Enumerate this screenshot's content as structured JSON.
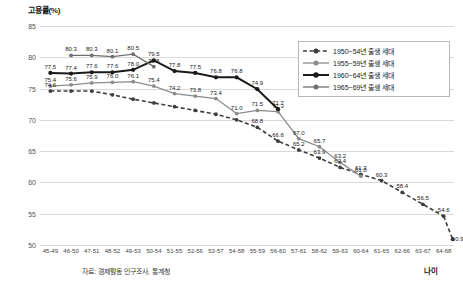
{
  "chart_data": {
    "type": "line",
    "title": "고용률(%)",
    "ylabel": "고용률(%)",
    "xlabel": "나이",
    "source_note": "자료: 경제활동 인구조사, 통계청",
    "ylim": [
      50,
      85
    ],
    "yticks": [
      50,
      55,
      60,
      65,
      70,
      75,
      80,
      85
    ],
    "grid": true,
    "legend_position": "top-right",
    "categories": [
      "45-49",
      "46-50",
      "47-51",
      "48-52",
      "49-53",
      "50-54",
      "51-55",
      "52-56",
      "53-57",
      "54-58",
      "55-59",
      "56-60",
      "57-61",
      "58-62",
      "59-63",
      "60-64",
      "61-65",
      "62-66",
      "63-67",
      "64-68"
    ],
    "series": [
      {
        "name": "1950~54년 출생 세대",
        "color": "#3d3d3d",
        "style": "dashed",
        "start_index": 0,
        "values": [
          74.6,
          74.6,
          74.6,
          74.0,
          73.3,
          72.7,
          72.1,
          71.5,
          70.9,
          70.0,
          68.8,
          66.6,
          65.2,
          63.9,
          62.4,
          61.3,
          60.3,
          58.4,
          56.5,
          54.6
        ],
        "labels": [
          "74.6",
          "",
          "",
          "",
          "",
          "",
          "",
          "",
          "",
          "",
          "68.8",
          "66.6",
          "65.2",
          "63.9",
          "62.4",
          "61.3",
          "60.3",
          "58.4",
          "56.5",
          "54.6"
        ],
        "final_label": "50.9"
      },
      {
        "name": "1955~59년 출생 세대",
        "color": "#8c8c8c",
        "style": "solid",
        "start_index": 0,
        "values": [
          75.4,
          75.6,
          75.9,
          76.0,
          76.1,
          75.4,
          74.2,
          73.8,
          73.4,
          71.0,
          71.5,
          71.3,
          67.0,
          65.7,
          63.2,
          61.0,
          null,
          null,
          null,
          null
        ],
        "labels": [
          "75.4",
          "75.6",
          "75.9",
          "76.0",
          "76.1",
          "75.4",
          "74.2",
          "73.8",
          "73.4",
          "71.0",
          "71.5",
          "71.3",
          "67.0",
          "65.7",
          "63.2",
          "61.0",
          "",
          "",
          "",
          ""
        ]
      },
      {
        "name": "1960~64년 출생 세대",
        "color": "#1a1a1a",
        "style": "solid-heavy",
        "start_index": 0,
        "values": [
          77.5,
          77.4,
          77.6,
          77.6,
          78.0,
          79.5,
          77.8,
          77.5,
          76.8,
          76.8,
          74.9,
          71.7,
          null,
          null,
          null,
          null,
          null,
          null,
          null,
          null
        ],
        "labels": [
          "77.5",
          "77.4",
          "77.6",
          "77.6",
          "78.0",
          "79.5",
          "77.8",
          "77.5",
          "76.8",
          "76.8",
          "74.9",
          "71.7",
          "",
          "",
          "",
          "",
          "",
          "",
          "",
          ""
        ]
      },
      {
        "name": "1965~69년 출생 세대",
        "color": "#6f6f6f",
        "style": "solid-light",
        "start_index": 1,
        "values": [
          null,
          80.3,
          80.3,
          80.1,
          80.5,
          78.5,
          null,
          null,
          null,
          null,
          null,
          null,
          null,
          null,
          null,
          null,
          null,
          null,
          null,
          null
        ],
        "labels": [
          "",
          "80.3",
          "80.3",
          "80.1",
          "80.5",
          "78.5",
          "",
          "",
          "",
          "",
          "",
          "",
          "",
          "",
          "",
          "",
          "",
          "",
          "",
          ""
        ]
      }
    ],
    "extra_labels": [
      {
        "text": "80.3",
        "x": 1,
        "y": 80.3
      },
      {
        "text": "80.3",
        "x": 2,
        "y": 80.3
      },
      {
        "text": "80.1",
        "x": 3,
        "y": 80.1
      },
      {
        "text": "80.5",
        "x": 4,
        "y": 80.5
      },
      {
        "text": "79.5",
        "x": 5,
        "y": 79.5
      },
      {
        "text": "78.5",
        "x": 6,
        "y": 78.5
      },
      {
        "text": "50.9",
        "x": 19,
        "y": 50.9
      }
    ]
  },
  "legend": {
    "items": [
      {
        "label": "1950~54년 출생 세대"
      },
      {
        "label": "1955~59년 출생 세대"
      },
      {
        "label": "1960~64년 출생 세대"
      },
      {
        "label": "1965~69년 출생 세대"
      }
    ]
  }
}
